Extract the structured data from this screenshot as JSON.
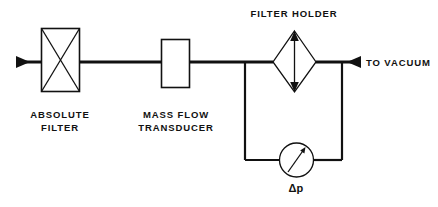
{
  "diagram": {
    "background_color": "#ffffff",
    "line_color": "#111111",
    "components": {
      "inlet": {
        "name": "inlet-flow-arrow",
        "icon": "arrow-right-icon"
      },
      "absolute_filter": {
        "label_line1": "ABSOLUTE",
        "label_line2": "FILTER",
        "icon": "crossed-box-icon"
      },
      "mass_flow_transducer": {
        "label_line1": "MASS FLOW",
        "label_line2": "TRANSDUCER",
        "icon": "rectangle-box-icon"
      },
      "filter_holder": {
        "label": "FILTER  HOLDER",
        "icon": "diamond-icon"
      },
      "pressure_gauge": {
        "label": "Δp",
        "icon": "gauge-dial-icon"
      },
      "outlet": {
        "label": "TO  VACUUM",
        "icon": "arrow-right-icon"
      }
    }
  }
}
